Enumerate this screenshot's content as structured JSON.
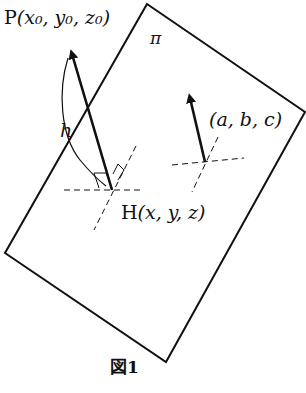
{
  "figure": {
    "caption": "図1",
    "plane_label": "π",
    "point_p": {
      "name": "P",
      "coords": "(x₀, y₀, z₀)"
    },
    "point_h": {
      "name": "H",
      "coords": "(x, y, z)"
    },
    "normal_vector": {
      "label": "(a, b, c)"
    },
    "distance_label": "h"
  },
  "colors": {
    "ink": "#111111",
    "background": "#ffffff"
  }
}
